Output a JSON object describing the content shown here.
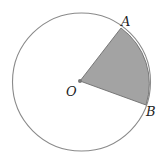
{
  "diagram": {
    "type": "circle-sector",
    "colors": {
      "circle_stroke": "#8a8a8a",
      "sector_fill": "#a3a3a3",
      "sector_stroke": "#6e6e6e",
      "center_dot": "#777777",
      "label": "#222222"
    },
    "circle": {
      "cx": 81.5,
      "cy": 82,
      "r": 69
    },
    "center": {
      "label": "O",
      "x": 80,
      "y": 81
    },
    "points": [
      {
        "label": "A",
        "x": 121,
        "y": 28
      },
      {
        "label": "B",
        "x": 146,
        "y": 105
      }
    ],
    "labels": {
      "O": "O",
      "A": "A",
      "B": "B"
    },
    "shaded_region": "sector AOB"
  }
}
